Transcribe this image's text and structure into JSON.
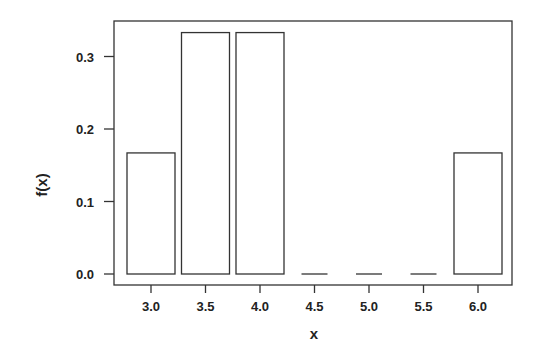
{
  "chart_data": {
    "type": "bar",
    "title": "",
    "xlabel": "x",
    "ylabel": "f(x)",
    "categories": [
      "3.0",
      "3.5",
      "4.0",
      "4.5",
      "5.0",
      "5.5",
      "6.0"
    ],
    "x": [
      3.0,
      3.5,
      4.0,
      4.5,
      5.0,
      5.5,
      6.0
    ],
    "values": [
      0.167,
      0.333,
      0.333,
      0.0,
      0.0,
      0.0,
      0.167
    ],
    "ylim": [
      0,
      0.35
    ],
    "xlim": [
      2.8,
      6.25
    ],
    "yticks": [
      0.0,
      0.1,
      0.2,
      0.3
    ],
    "ytick_labels": [
      "0.0",
      "0.1",
      "0.2",
      "0.3"
    ],
    "xticks": [
      3.0,
      3.5,
      4.0,
      4.5,
      5.0,
      5.5,
      6.0
    ],
    "xtick_labels": [
      "3.0",
      "3.5",
      "4.0",
      "4.5",
      "5.0",
      "5.5",
      "6.0"
    ],
    "grid": false,
    "legend": null,
    "bar_fill": "#ffffff",
    "bar_stroke": "#333333"
  }
}
